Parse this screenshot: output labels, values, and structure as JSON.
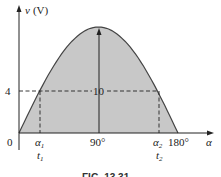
{
  "figure": {
    "y_axis_label": "v (V)",
    "x_axis_label": "α",
    "origin_label": "0",
    "peak_label": "10",
    "level_label": "4",
    "tick_90": "90°",
    "tick_180": "180°",
    "alpha1": "α",
    "alpha1_sub": "1",
    "alpha2": "α",
    "alpha2_sub": "2",
    "t1": "t",
    "t1_sub": "1",
    "t2": "t",
    "t2_sub": "2",
    "caption": "FIG. 13.31",
    "fill_color": "#c8c8c8",
    "line_color": "#333333"
  },
  "curve": {
    "type": "sine-half-cycle",
    "amplitude_V": 10,
    "level_V": 4,
    "x_start_deg": 0,
    "x_peak_deg": 90,
    "x_end_deg": 180
  }
}
